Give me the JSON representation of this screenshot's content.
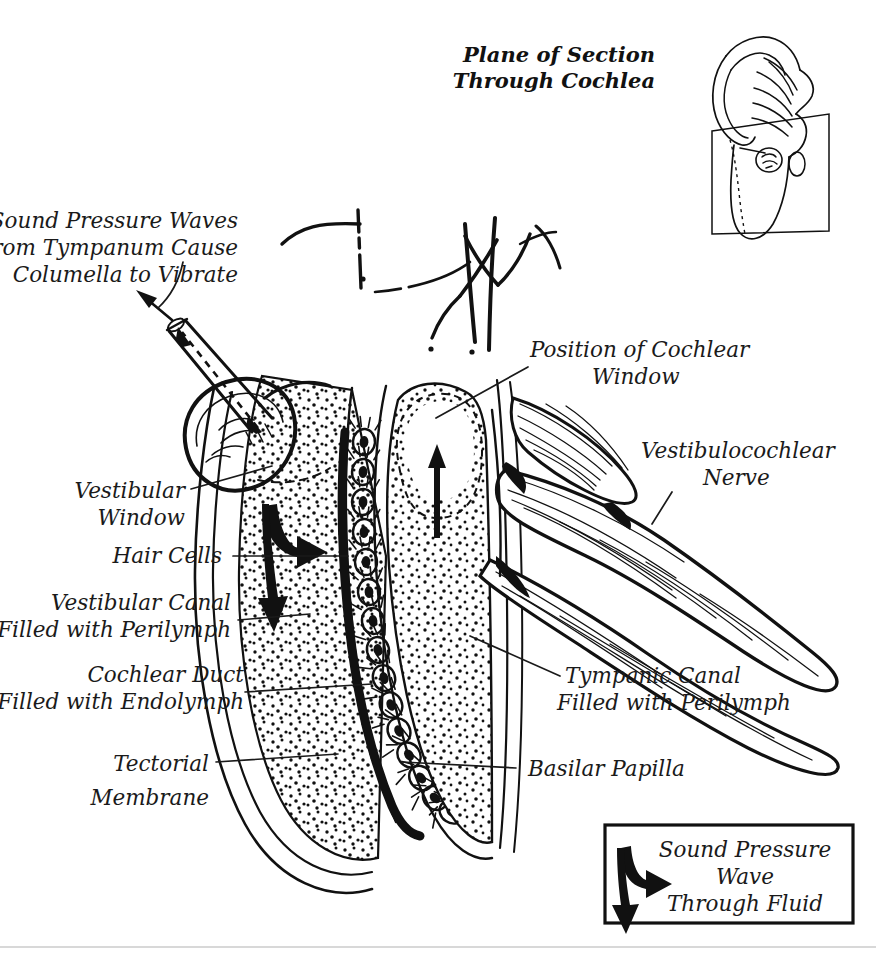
{
  "figure": {
    "title": "Plane of Section Through Cochlea",
    "title_lines": [
      "Plane of Section",
      "Through Cochlea"
    ],
    "background_color": "#ffffff",
    "ink_color": "#111111"
  },
  "inset": {
    "name": "head-ear-section-plane-inset",
    "description": "Lateral view of head with ear showing cutting plane through cochlea"
  },
  "labels": {
    "sound_pressure_waves": {
      "lines": [
        "Sound Pressure Waves",
        "from Tympanum Cause",
        "Columella to Vibrate"
      ],
      "anchor": "end",
      "x": 238,
      "y": 228
    },
    "vestibular_window": {
      "lines": [
        "Vestibular",
        "Window"
      ],
      "anchor": "end",
      "x": 185,
      "y": 498
    },
    "hair_cells": {
      "lines": [
        "Hair Cells"
      ],
      "anchor": "end",
      "x": 222,
      "y": 561
    },
    "vestibular_canal": {
      "lines": [
        "Vestibular Canal",
        "Filled with Perilymph"
      ],
      "anchor": "end",
      "x": 231,
      "y": 604
    },
    "cochlear_duct": {
      "lines": [
        "Cochlear Duct",
        "Filled with  Endolymph"
      ],
      "anchor": "end",
      "x": 244,
      "y": 676
    },
    "tectorial_membrane": {
      "lines": [
        "Tectorial",
        "Membrane"
      ],
      "anchor": "end",
      "x": 209,
      "y": 771
    },
    "position_cochlear_window": {
      "lines": [
        "Position of Cochlear",
        "Window"
      ],
      "anchor": "start",
      "x": 530,
      "y": 357
    },
    "vestibulocochlear_nerve": {
      "lines": [
        "Vestibulocochlear",
        "Nerve"
      ],
      "anchor": "start",
      "x": 641,
      "y": 458
    },
    "tympanic_canal": {
      "lines": [
        "Tympanic Canal",
        "Filled with Perilymph"
      ],
      "anchor": "start",
      "x": 565,
      "y": 683
    },
    "basilar_papilla": {
      "lines": [
        "Basilar Papilla"
      ],
      "anchor": "start",
      "x": 528,
      "y": 776
    }
  },
  "legend": {
    "name": "sound-pressure-wave-legend",
    "lines": [
      "Sound Pressure",
      "Wave",
      "Through Fluid"
    ],
    "box": {
      "x": 605,
      "y": 825,
      "width": 248,
      "height": 98
    },
    "arrow_name": "sound-pressure-wave-arrow"
  },
  "annotations": {
    "columella_arrow": "columella-vibration-arrow",
    "vestibular_wave_arrow": "vestibular-canal-wave-arrow",
    "tympanic_wave_arrow": "tympanic-canal-wave-arrow"
  },
  "structures": [
    "columella",
    "vestibular-window",
    "vestibular-canal",
    "cochlear-duct",
    "tympanic-canal",
    "hair-cells",
    "tectorial-membrane",
    "basilar-papilla",
    "vestibulocochlear-nerve",
    "cochlear-window"
  ]
}
